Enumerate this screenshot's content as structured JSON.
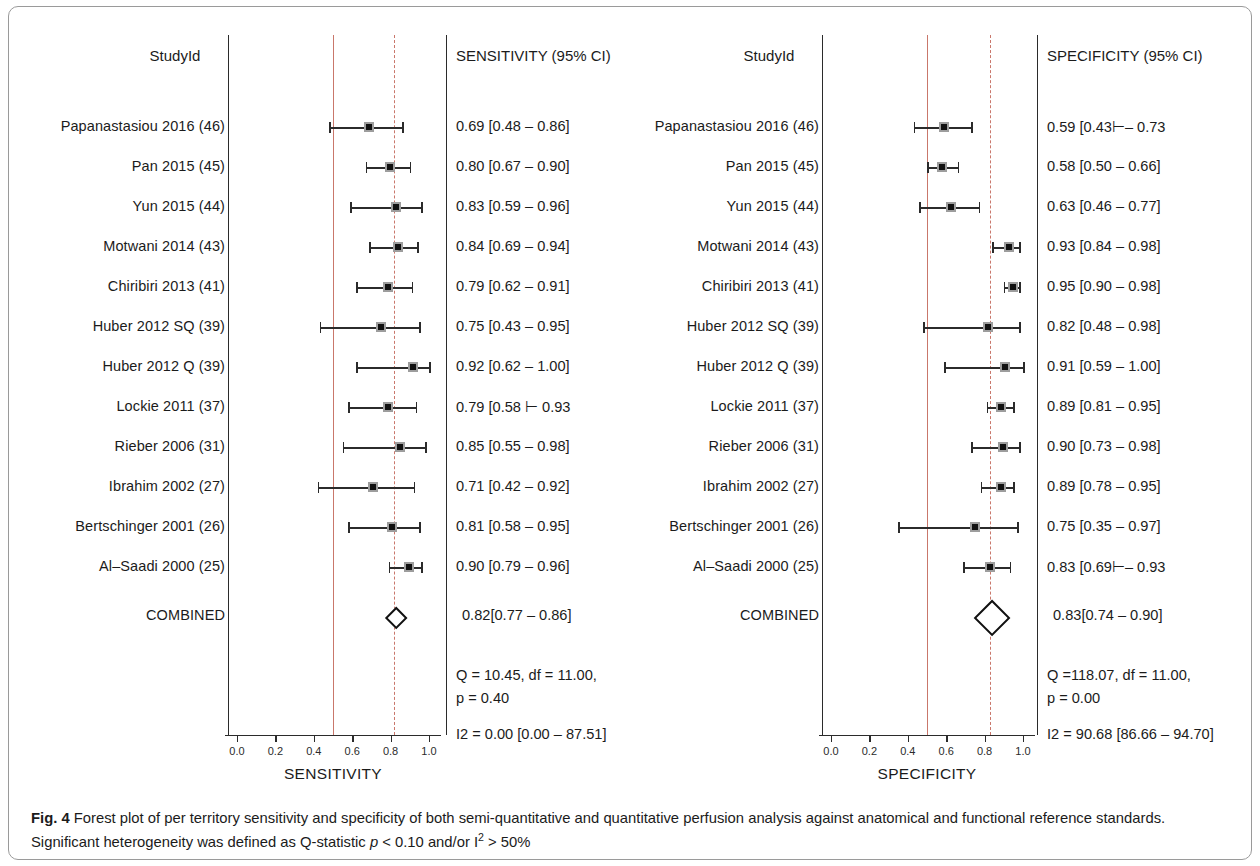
{
  "figure": {
    "caption_label": "Fig. 4",
    "caption_part1": " Forest plot of per territory sensitivity and specificity of both semi-quantitative and quantitative perfusion analysis against anatomical and functional reference standards. Significant heterogeneity was defined as Q-statistic ",
    "caption_italic_p": "p",
    "caption_part2": " < 0.10 and/or I",
    "caption_sup": "2",
    "caption_part3": " > 50%"
  },
  "colors": {
    "pooled_line": "#c9776b",
    "reference_line": "#c9776b",
    "marker_fill": "#111111",
    "marker_edge": "#9d9d9d",
    "axis": "#2b2b2b"
  },
  "chart_data": [
    {
      "type": "forest",
      "title": "",
      "panel_id": "sensitivity",
      "study_header": "StudyId",
      "estimate_header": "SENSITIVITY (95% CI)",
      "xlabel": "SENSITIVITY",
      "xlim": [
        0.0,
        1.0
      ],
      "xticks": [
        0.0,
        0.2,
        0.4,
        0.6,
        0.8,
        1.0
      ],
      "xtick_labels": [
        "0.0",
        "0.2",
        "0.4",
        "0.6",
        "0.8",
        "1.0"
      ],
      "reference_line": 0.5,
      "pooled_line": 0.82,
      "grid": false,
      "rows": [
        {
          "study": "Papanastasiou 2016 (46)",
          "est": 0.69,
          "lo": 0.48,
          "hi": 0.86,
          "text": "0.69 [0.48 – 0.86]"
        },
        {
          "study": "Pan 2015 (45)",
          "est": 0.8,
          "lo": 0.67,
          "hi": 0.9,
          "text": "0.80 [0.67 – 0.90]"
        },
        {
          "study": "Yun 2015 (44)",
          "est": 0.83,
          "lo": 0.59,
          "hi": 0.96,
          "text": "0.83 [0.59 – 0.96]"
        },
        {
          "study": "Motwani 2014 (43)",
          "est": 0.84,
          "lo": 0.69,
          "hi": 0.94,
          "text": "0.84 [0.69 – 0.94]"
        },
        {
          "study": "Chiribiri 2013 (41)",
          "est": 0.79,
          "lo": 0.62,
          "hi": 0.91,
          "text": "0.79 [0.62 – 0.91]"
        },
        {
          "study": "Huber 2012 SQ (39)",
          "est": 0.75,
          "lo": 0.43,
          "hi": 0.95,
          "text": "0.75 [0.43 – 0.95]"
        },
        {
          "study": "Huber 2012 Q (39)",
          "est": 0.92,
          "lo": 0.62,
          "hi": 1.0,
          "text": "0.92 [0.62 – 1.00]"
        },
        {
          "study": "Lockie 2011 (37)",
          "est": 0.79,
          "lo": 0.58,
          "hi": 0.93,
          "text": "0.79 [0.58 ⊢ 0.93"
        },
        {
          "study": "Rieber 2006 (31)",
          "est": 0.85,
          "lo": 0.55,
          "hi": 0.98,
          "text": "0.85 [0.55 – 0.98]"
        },
        {
          "study": "Ibrahim 2002 (27)",
          "est": 0.71,
          "lo": 0.42,
          "hi": 0.92,
          "text": "0.71 [0.42 – 0.92]"
        },
        {
          "study": "Bertschinger 2001 (26)",
          "est": 0.81,
          "lo": 0.58,
          "hi": 0.95,
          "text": "0.81 [0.58 – 0.95]"
        },
        {
          "study": "Al–Saadi 2000 (25)",
          "est": 0.9,
          "lo": 0.79,
          "hi": 0.96,
          "text": "0.90 [0.79 – 0.96]"
        }
      ],
      "combined": {
        "label": "COMBINED",
        "est": 0.82,
        "lo": 0.77,
        "hi": 0.86,
        "text": "0.82[0.77 – 0.86]"
      },
      "heterogeneity": {
        "q_line": "Q = 10.45, df = 11.00,",
        "p_line": "p =  0.40",
        "i2_line": "I2 = 0.00 [0.00 – 87.51]"
      }
    },
    {
      "type": "forest",
      "title": "",
      "panel_id": "specificity",
      "study_header": "StudyId",
      "estimate_header": "SPECIFICITY (95% CI)",
      "xlabel": "SPECIFICITY",
      "xlim": [
        0.0,
        1.0
      ],
      "xticks": [
        0.0,
        0.2,
        0.4,
        0.6,
        0.8,
        1.0
      ],
      "xtick_labels": [
        "0.0",
        "0.2",
        "0.4",
        "0.6",
        "0.8",
        "1.0"
      ],
      "reference_line": 0.5,
      "pooled_line": 0.83,
      "grid": false,
      "rows": [
        {
          "study": "Papanastasiou 2016 (46)",
          "est": 0.59,
          "lo": 0.43,
          "hi": 0.73,
          "text": "0.59 [0.43⊢– 0.73"
        },
        {
          "study": "Pan 2015 (45)",
          "est": 0.58,
          "lo": 0.5,
          "hi": 0.66,
          "text": "0.58 [0.50 – 0.66]"
        },
        {
          "study": "Yun 2015 (44)",
          "est": 0.63,
          "lo": 0.46,
          "hi": 0.77,
          "text": "0.63 [0.46 – 0.77]"
        },
        {
          "study": "Motwani 2014 (43)",
          "est": 0.93,
          "lo": 0.84,
          "hi": 0.98,
          "text": "0.93 [0.84 – 0.98]"
        },
        {
          "study": "Chiribiri 2013 (41)",
          "est": 0.95,
          "lo": 0.9,
          "hi": 0.98,
          "text": "0.95 [0.90 – 0.98]"
        },
        {
          "study": "Huber 2012 SQ (39)",
          "est": 0.82,
          "lo": 0.48,
          "hi": 0.98,
          "text": "0.82 [0.48 – 0.98]"
        },
        {
          "study": "Huber 2012 Q (39)",
          "est": 0.91,
          "lo": 0.59,
          "hi": 1.0,
          "text": "0.91 [0.59 – 1.00]"
        },
        {
          "study": "Lockie 2011 (37)",
          "est": 0.89,
          "lo": 0.81,
          "hi": 0.95,
          "text": "0.89 [0.81 – 0.95]"
        },
        {
          "study": "Rieber 2006 (31)",
          "est": 0.9,
          "lo": 0.73,
          "hi": 0.98,
          "text": "0.90 [0.73 – 0.98]"
        },
        {
          "study": "Ibrahim 2002 (27)",
          "est": 0.89,
          "lo": 0.78,
          "hi": 0.95,
          "text": "0.89 [0.78 – 0.95]"
        },
        {
          "study": "Bertschinger 2001 (26)",
          "est": 0.75,
          "lo": 0.35,
          "hi": 0.97,
          "text": "0.75 [0.35 – 0.97]"
        },
        {
          "study": "Al–Saadi 2000 (25)",
          "est": 0.83,
          "lo": 0.69,
          "hi": 0.93,
          "text": "0.83 [0.69⊢– 0.93"
        }
      ],
      "combined": {
        "label": "COMBINED",
        "est": 0.83,
        "lo": 0.74,
        "hi": 0.9,
        "text": "0.83[0.74 – 0.90]"
      },
      "heterogeneity": {
        "q_line": "Q =118.07, df = 11.00,",
        "p_line": "p =  0.00",
        "i2_line": "I2 = 90.68 [86.66 – 94.70]"
      }
    }
  ]
}
